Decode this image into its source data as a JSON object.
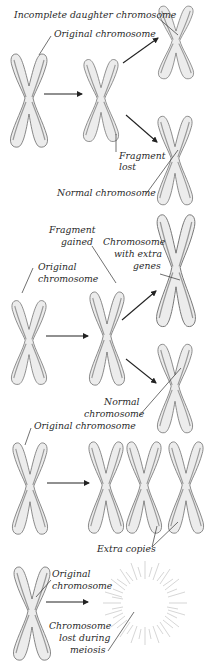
{
  "diagram": {
    "title": "",
    "panels": [
      {
        "id": "deletion",
        "labels": {
          "incomplete": "Incomplete daughter chromosome",
          "original": "Original chromosome",
          "fragment_lost_1": "Fragment",
          "fragment_lost_2": "lost",
          "normal": "Normal chromosome"
        }
      },
      {
        "id": "duplication",
        "labels": {
          "fragment_gained_1": "Fragment",
          "fragment_gained_2": "gained",
          "original_1": "Original",
          "original_2": "chromosome",
          "extra_genes_1": "Chromosome",
          "extra_genes_2": "with extra",
          "extra_genes_3": "genes",
          "normal_1": "Normal",
          "normal_2": "chromosome"
        }
      },
      {
        "id": "trisomy",
        "labels": {
          "original": "Original chromosome",
          "extra_copies": "Extra copies"
        }
      },
      {
        "id": "loss",
        "labels": {
          "original_1": "Original",
          "original_2": "chromosome",
          "lost_1": "Chromosome",
          "lost_2": "lost during",
          "lost_3": "meiosis"
        }
      }
    ],
    "colors": {
      "chromosome_fill": "#ececec",
      "chromosome_outline": "#6a6a6a",
      "text": "#2a2a2a",
      "arrow": "#222222"
    }
  }
}
